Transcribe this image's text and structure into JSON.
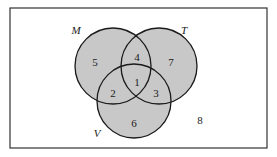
{
  "diagram": {
    "type": "venn-3",
    "colors": {
      "fill": "#c8c8c8",
      "stroke": "#1a1a1a",
      "background": "#ffffff",
      "border": "#333333"
    },
    "universe": {
      "x": 10,
      "y": 8,
      "w": 257,
      "h": 140,
      "outside_region_label": "8"
    },
    "sets": [
      {
        "name": "M",
        "cx": 113,
        "cy": 66,
        "r": 38,
        "label_x": 76,
        "label_y": 34
      },
      {
        "name": "T",
        "cx": 159,
        "cy": 66,
        "r": 38,
        "label_x": 184,
        "label_y": 34
      },
      {
        "name": "V",
        "cx": 134,
        "cy": 101,
        "r": 37,
        "label_x": 97,
        "label_y": 137
      }
    ],
    "regions": [
      {
        "label": "5",
        "x": 95,
        "y": 62,
        "desc": "M only"
      },
      {
        "label": "4",
        "x": 137,
        "y": 57,
        "desc": "M and T only"
      },
      {
        "label": "7",
        "x": 171,
        "y": 62,
        "desc": "T only"
      },
      {
        "label": "1",
        "x": 137,
        "y": 82,
        "desc": "M, T and V"
      },
      {
        "label": "2",
        "x": 113,
        "y": 93,
        "desc": "M and V only"
      },
      {
        "label": "3",
        "x": 156,
        "y": 93,
        "desc": "T and V only"
      },
      {
        "label": "6",
        "x": 134,
        "y": 123,
        "desc": "V only"
      },
      {
        "label": "8",
        "x": 200,
        "y": 120,
        "desc": "none"
      }
    ]
  }
}
